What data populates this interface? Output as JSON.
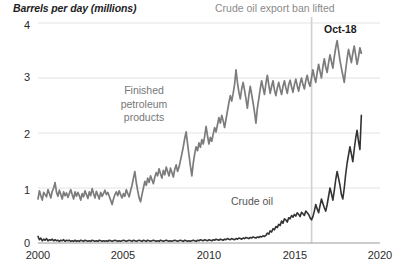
{
  "chart_data": {
    "type": "line",
    "title": "",
    "ylabel": "Barrels per day (millions)",
    "xlabel": "",
    "xlim": [
      2000,
      2020
    ],
    "ylim": [
      0,
      4
    ],
    "grid": true,
    "legend": "inline-labels",
    "y_ticks": [
      "0",
      "1",
      "2",
      "3",
      "4"
    ],
    "y_tick_values": [
      0,
      1,
      2,
      3,
      4
    ],
    "x_ticks": [
      "2000",
      "2005",
      "2010",
      "2015",
      "2020"
    ],
    "x_tick_values": [
      2000,
      2005,
      2010,
      2015,
      2020
    ],
    "annotations": [
      {
        "name": "export-ban-line",
        "text": "Crude oil export ban lifted",
        "x": 2016.0,
        "type": "vline-with-label"
      },
      {
        "name": "last-point-label",
        "text": "Oct-18",
        "x": 2018.79,
        "type": "endpoint-label"
      }
    ],
    "series": [
      {
        "name": "Finished petroleum products",
        "label": "Finished petroleum products",
        "color": "#7c7c7c",
        "x_start": 2000.0,
        "x_step": 0.0833,
        "values": [
          0.8,
          0.95,
          0.86,
          0.78,
          0.92,
          0.88,
          0.84,
          0.97,
          0.9,
          0.82,
          0.94,
          1.0,
          1.1,
          0.92,
          0.85,
          0.96,
          0.88,
          0.8,
          0.93,
          0.86,
          0.91,
          0.83,
          0.9,
          0.97,
          0.88,
          0.8,
          0.93,
          0.85,
          0.92,
          0.86,
          0.78,
          0.9,
          0.84,
          0.95,
          0.88,
          0.81,
          0.93,
          0.86,
          0.99,
          0.9,
          0.82,
          0.94,
          0.87,
          0.8,
          0.92,
          0.85,
          0.9,
          0.96,
          0.88,
          0.92,
          0.85,
          0.78,
          0.7,
          0.8,
          0.88,
          0.93,
          0.86,
          0.95,
          0.88,
          0.82,
          0.9,
          0.85,
          0.97,
          0.9,
          0.84,
          0.95,
          1.05,
          1.18,
          1.3,
          1.1,
          0.95,
          0.82,
          0.75,
          0.88,
          1.0,
          1.12,
          1.05,
          1.18,
          1.1,
          1.22,
          1.15,
          1.08,
          1.2,
          1.28,
          1.22,
          1.35,
          1.26,
          1.18,
          1.32,
          1.24,
          1.38,
          1.3,
          1.22,
          1.36,
          1.28,
          1.2,
          1.34,
          1.42,
          1.3,
          1.38,
          1.5,
          1.62,
          1.75,
          1.9,
          2.02,
          1.8,
          1.6,
          1.4,
          1.22,
          1.45,
          1.62,
          1.75,
          1.68,
          1.82,
          1.74,
          1.88,
          1.8,
          1.94,
          2.12,
          1.95,
          1.8,
          1.92,
          1.85,
          1.98,
          2.1,
          2.02,
          2.15,
          2.28,
          2.18,
          2.32,
          2.22,
          2.1,
          2.25,
          2.4,
          2.55,
          2.68,
          2.58,
          2.72,
          2.88,
          3.15,
          2.92,
          2.75,
          2.62,
          2.8,
          2.92,
          2.78,
          2.62,
          2.45,
          2.68,
          2.85,
          2.7,
          2.55,
          2.38,
          2.18,
          2.45,
          2.62,
          2.8,
          2.95,
          2.82,
          2.7,
          2.9,
          3.05,
          2.88,
          2.72,
          2.85,
          2.95,
          2.78,
          2.68,
          2.82,
          2.92,
          2.8,
          2.7,
          2.85,
          2.95,
          2.82,
          2.72,
          2.88,
          2.96,
          2.84,
          2.74,
          2.88,
          2.98,
          2.86,
          2.76,
          2.9,
          3.0,
          2.88,
          2.8,
          2.95,
          3.05,
          2.92,
          2.85,
          3.0,
          3.15,
          3.02,
          2.92,
          3.1,
          3.25,
          3.12,
          3.0,
          3.2,
          3.35,
          3.2,
          3.1,
          3.28,
          3.42,
          3.3,
          3.18,
          3.38,
          3.55,
          3.68,
          3.5,
          3.32,
          3.18,
          3.05,
          2.92,
          3.15,
          3.35,
          3.52,
          3.4,
          3.28,
          3.45,
          3.58,
          3.42,
          3.25,
          3.38,
          3.55,
          3.45
        ]
      },
      {
        "name": "Crude oil",
        "label": "Crude oil",
        "color": "#333333",
        "x_start": 2000.0,
        "x_step": 0.0833,
        "values": [
          0.12,
          0.06,
          0.09,
          0.04,
          0.07,
          0.05,
          0.08,
          0.04,
          0.06,
          0.05,
          0.07,
          0.04,
          0.06,
          0.04,
          0.05,
          0.03,
          0.05,
          0.04,
          0.06,
          0.03,
          0.05,
          0.04,
          0.05,
          0.03,
          0.04,
          0.03,
          0.05,
          0.03,
          0.04,
          0.03,
          0.05,
          0.04,
          0.03,
          0.05,
          0.04,
          0.03,
          0.04,
          0.03,
          0.05,
          0.04,
          0.03,
          0.04,
          0.03,
          0.05,
          0.04,
          0.03,
          0.04,
          0.03,
          0.04,
          0.03,
          0.05,
          0.04,
          0.03,
          0.04,
          0.05,
          0.04,
          0.03,
          0.04,
          0.03,
          0.04,
          0.05,
          0.04,
          0.03,
          0.04,
          0.05,
          0.04,
          0.03,
          0.05,
          0.04,
          0.03,
          0.04,
          0.05,
          0.04,
          0.03,
          0.05,
          0.04,
          0.03,
          0.05,
          0.04,
          0.03,
          0.04,
          0.05,
          0.04,
          0.03,
          0.04,
          0.03,
          0.05,
          0.04,
          0.03,
          0.04,
          0.05,
          0.04,
          0.03,
          0.04,
          0.03,
          0.04,
          0.05,
          0.04,
          0.03,
          0.04,
          0.05,
          0.04,
          0.03,
          0.05,
          0.04,
          0.03,
          0.04,
          0.03,
          0.04,
          0.05,
          0.04,
          0.03,
          0.05,
          0.04,
          0.06,
          0.05,
          0.04,
          0.06,
          0.05,
          0.04,
          0.06,
          0.05,
          0.04,
          0.06,
          0.05,
          0.07,
          0.06,
          0.05,
          0.07,
          0.06,
          0.05,
          0.07,
          0.06,
          0.08,
          0.07,
          0.06,
          0.08,
          0.07,
          0.06,
          0.08,
          0.07,
          0.09,
          0.08,
          0.07,
          0.09,
          0.08,
          0.1,
          0.09,
          0.08,
          0.1,
          0.09,
          0.11,
          0.1,
          0.09,
          0.11,
          0.1,
          0.12,
          0.11,
          0.13,
          0.12,
          0.14,
          0.18,
          0.16,
          0.22,
          0.2,
          0.26,
          0.24,
          0.3,
          0.28,
          0.34,
          0.32,
          0.4,
          0.36,
          0.44,
          0.42,
          0.38,
          0.46,
          0.44,
          0.5,
          0.47,
          0.52,
          0.49,
          0.55,
          0.52,
          0.48,
          0.56,
          0.53,
          0.5,
          0.58,
          0.55,
          0.52,
          0.46,
          0.42,
          0.48,
          0.58,
          0.7,
          0.62,
          0.55,
          0.68,
          0.8,
          0.72,
          0.64,
          0.58,
          0.7,
          0.85,
          1.0,
          0.9,
          0.78,
          0.95,
          1.15,
          1.3,
          1.18,
          1.05,
          0.88,
          0.8,
          1.0,
          1.25,
          1.45,
          1.6,
          1.75,
          1.62,
          1.48,
          1.7,
          1.9,
          2.05,
          1.85,
          1.7,
          2.32
        ]
      }
    ]
  },
  "axis_title": "Barrels per day (millions)",
  "labels": {
    "finished": "Finished\npetroleum\nproducts",
    "finished_lines": [
      "Finished",
      "petroleum",
      "products"
    ],
    "crude": "Crude oil",
    "ban": "Crude oil export ban lifted",
    "oct18": "Oct-18"
  },
  "colors": {
    "finished": "#7c7c7c",
    "crude": "#333333",
    "grid": "#e2e2e2",
    "axis": "#9a9a9a",
    "vline": "#d0d0d0",
    "text": "#2b2b2b",
    "annotation": "#8a8a8a"
  }
}
